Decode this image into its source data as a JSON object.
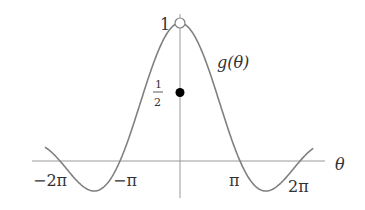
{
  "figure": {
    "function_label": "g(θ)",
    "axis_label_x": "θ",
    "y_labels": {
      "one": "1",
      "half_num": "1",
      "half_den": "2"
    },
    "x_ticks": [
      {
        "label": "−2π",
        "value": -6.2832
      },
      {
        "label": "−π",
        "value": -3.1416
      },
      {
        "label": "π",
        "value": 3.1416
      },
      {
        "label": "2π",
        "value": 6.2832
      }
    ],
    "points": [
      {
        "name": "open-circle",
        "theta": 0,
        "value": 1,
        "filled": false
      },
      {
        "name": "filled-dot",
        "theta": 0,
        "value": 0.5,
        "filled": true
      }
    ],
    "colors": {
      "curve": "#808080",
      "axis": "#9a9a9a",
      "text": "#333333",
      "dot": "#000000"
    }
  },
  "chart_data": {
    "type": "line",
    "title": "",
    "xlabel": "θ",
    "ylabel": "",
    "series": [
      {
        "name": "g(θ)",
        "formula": "sin(θ)/θ",
        "x_range": [
          -7.07,
          6.98
        ]
      }
    ],
    "x_tick_labels": [
      "−2π",
      "−π",
      "π",
      "2π"
    ],
    "y_tick_labels": [
      "1",
      "1/2"
    ],
    "xlim": [
      -7.07,
      6.98
    ],
    "ylim": [
      -0.217,
      1
    ],
    "grid": false,
    "annotations": [
      {
        "x": 0,
        "y": 1,
        "marker": "open circle"
      },
      {
        "x": 0,
        "y": 0.5,
        "marker": "filled circle"
      }
    ]
  }
}
